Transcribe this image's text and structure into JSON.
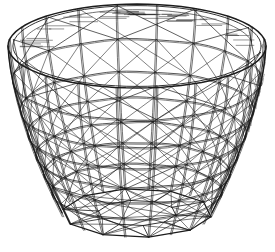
{
  "illustration": {
    "canvas": {
      "width": 275,
      "height": 252,
      "background": "#ffffff"
    },
    "ink": "#1c1c1c",
    "basket": {
      "cx": 137,
      "cyBase": 213,
      "sx": 129,
      "syRise": 121,
      "syDepth": 42,
      "height": 1.38,
      "rTop": 1.0,
      "rBase": 0.58,
      "taperExp": 1.55,
      "ribs": 20,
      "rings": [
        0.2,
        0.38,
        0.52,
        0.65,
        0.76,
        0.87
      ],
      "rimInnerScale": 0.962,
      "rimBackEdgeScale": 0.9,
      "baseInnerScale": 0.52
    },
    "strokes": {
      "rimOuter": 1.5,
      "rimInner": 0.9,
      "silhouette": 1.4,
      "rib": 0.65,
      "ring": 0.75,
      "ringDouble": 0.6,
      "diagonal": 0.6,
      "topDiagonal": 0.7,
      "basePolygon": 1.3,
      "baseInner": 0.9,
      "spoke": 0.8,
      "baseBrace": 0.65,
      "hatch": 0.55,
      "stipple": 0.55
    },
    "shading": {
      "rimHatchCount": 46,
      "stippleCount": 58,
      "seed": 11
    }
  }
}
